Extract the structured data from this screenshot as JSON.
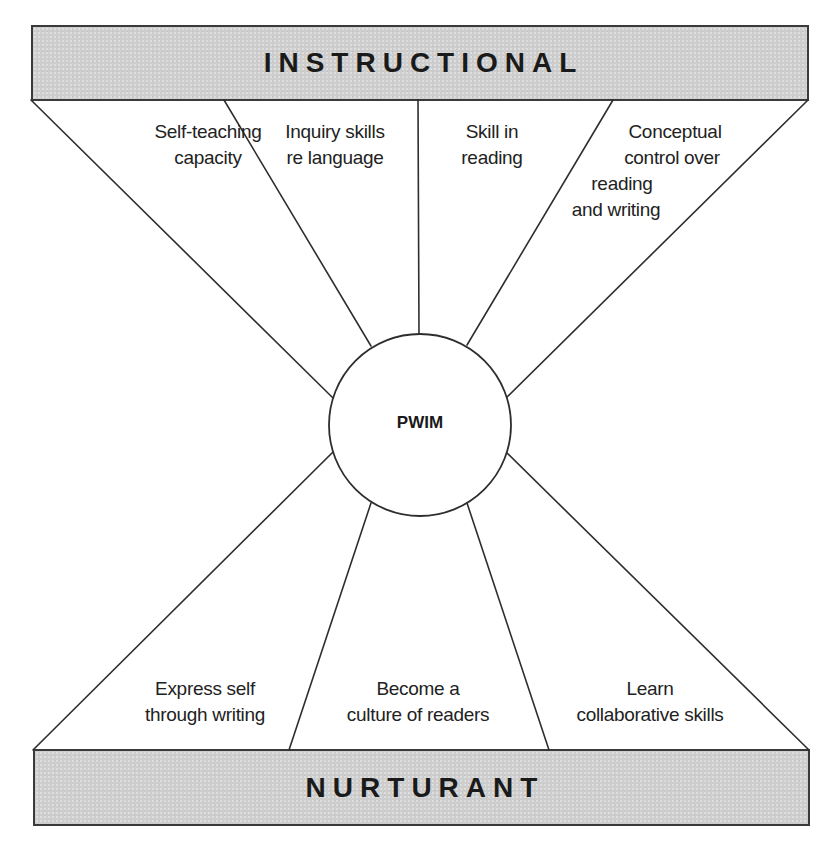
{
  "diagram": {
    "top_band": {
      "title": "INSTRUCTIONAL",
      "fill": "#cdcdcd"
    },
    "bottom_band": {
      "title": "NURTURANT",
      "fill": "#cdcdcd"
    },
    "center": {
      "label": "PWIM"
    },
    "instructional_goals": [
      {
        "lines": [
          "Self-teaching",
          "capacity"
        ]
      },
      {
        "lines": [
          "Inquiry skills",
          "re language"
        ]
      },
      {
        "lines": [
          "Skill in",
          "reading"
        ]
      },
      {
        "lines": [
          "Conceptual",
          "control over",
          "reading",
          "and writing"
        ]
      }
    ],
    "nurturant_goals": [
      {
        "lines": [
          "Express self",
          "through writing"
        ]
      },
      {
        "lines": [
          "Become a",
          "culture of readers"
        ]
      },
      {
        "lines": [
          "Learn",
          "collaborative skills"
        ]
      }
    ],
    "colors": {
      "line": "#2e2e2e",
      "band_fill": "#cdcdcd",
      "band_border": "#3a3a3a",
      "background": "#ffffff"
    }
  }
}
